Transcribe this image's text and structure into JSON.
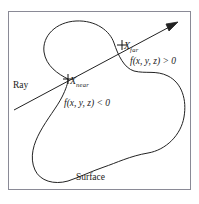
{
  "figure": {
    "type": "implicit-surface-ray-intersection-diagram",
    "frame": {
      "stroke": "#8a8a96",
      "x": 8,
      "y": 11,
      "width": 183,
      "height": 179
    },
    "stroke_color": "#222222",
    "background": "#ffffff",
    "labels": {
      "ray": "Ray",
      "x_near_symbol": "X",
      "x_near_subscript": "near",
      "x_far_symbol": "X",
      "x_far_subscript": "far",
      "f_positive": "f(x, y, z) > 0",
      "f_negative": "f(x, y, z) < 0",
      "surface": "Surface"
    },
    "markers": [
      {
        "name": "x-near-cross",
        "x": 68,
        "y": 79
      },
      {
        "name": "x-far-cross",
        "x": 122,
        "y": 45
      }
    ],
    "ray": {
      "start_x": 14,
      "start_y": 110,
      "end_x": 178,
      "end_y": 22,
      "arrow_at": "end"
    }
  }
}
